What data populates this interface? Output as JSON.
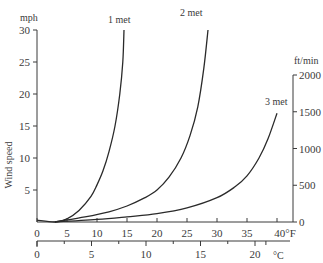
{
  "chart_data": {
    "type": "line",
    "title": "",
    "xlabel": "Temperature (°F / °C)",
    "ylabel": "Wind speed",
    "y_left": {
      "unit": "mph",
      "label": "Wind speed",
      "range": [
        0,
        30
      ],
      "ticks": [
        30,
        25,
        20,
        15,
        10,
        5
      ]
    },
    "y_right": {
      "unit": "ft/min",
      "range": [
        0,
        2000
      ],
      "ticks": [
        2000,
        1500,
        1000,
        500,
        0
      ]
    },
    "x_primary": {
      "unit": "°F",
      "range": [
        0,
        40
      ],
      "ticks": [
        "0",
        "5",
        "10",
        "15",
        "20",
        "25",
        "30",
        "35",
        "40°F"
      ]
    },
    "x_secondary": {
      "unit": "°C",
      "range": [
        0,
        20
      ],
      "ticks": [
        "0",
        "5",
        "10",
        "15",
        "20"
      ],
      "unit_label": "°C"
    },
    "grid": false,
    "legend": "inline labels at curve ends",
    "series": [
      {
        "name": "1 met",
        "x_degF": [
          0,
          3,
          5,
          7,
          9,
          10,
          11,
          12,
          13,
          13.8,
          14.3,
          14.5
        ],
        "y_mph": [
          0.3,
          0,
          0.5,
          1.8,
          4,
          5.8,
          8,
          11,
          15,
          20,
          25,
          30
        ]
      },
      {
        "name": "2 met",
        "x_degF": [
          3,
          8,
          12,
          15,
          18,
          20,
          22,
          24,
          25.5,
          26.8,
          27.8,
          28.5
        ],
        "y_mph": [
          0,
          0.8,
          1.6,
          2.5,
          3.8,
          5,
          7,
          10,
          13.5,
          18,
          24,
          30
        ]
      },
      {
        "name": "3 met",
        "x_degF": [
          3,
          10,
          15,
          20,
          25,
          30,
          33,
          35,
          37,
          38.5,
          40
        ],
        "y_mph": [
          0,
          0.4,
          0.8,
          1.3,
          2.2,
          3.8,
          5.5,
          7.2,
          10,
          13,
          17
        ]
      }
    ]
  },
  "labels": {
    "mph": "mph",
    "ftmin": "ft/min",
    "wind_speed": "Wind speed",
    "celsius": "°C",
    "met1": "1 met",
    "met2": "2 met",
    "met3": "3 met"
  }
}
